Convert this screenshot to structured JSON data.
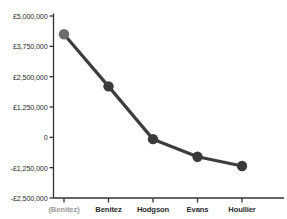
{
  "chart_data": {
    "type": "line",
    "title": "",
    "xlabel": "",
    "ylabel": "",
    "categories": [
      "(Benitez)",
      "Benitez",
      "Hodgson",
      "Evans",
      "Houllier"
    ],
    "values": [
      4250000,
      2100000,
      -75000,
      -800000,
      -1180000
    ],
    "ylim": [
      -2500000,
      5000000
    ],
    "ytick_values": [
      5000000,
      3750000,
      2500000,
      1250000,
      0,
      -1250000,
      -2500000
    ],
    "ytick_labels": [
      "£5,000,000",
      "£3,750,000",
      "£2,500,000",
      "£1,250,000",
      "0",
      "-£1,250,000",
      "-£2,500,000"
    ],
    "grid": false,
    "legend": "none",
    "series": [
      {
        "name": "Net spend",
        "values": [
          4250000,
          2100000,
          -75000,
          -800000,
          -1180000
        ]
      }
    ]
  },
  "axis": {
    "y_axis_name": "y-axis",
    "x_axis_name": "x-axis"
  },
  "style": {
    "line_color": "#3d3d3d",
    "marker_color": "#3a3a3a",
    "first_marker_color": "#6d6d6d",
    "axis_color": "#333333",
    "label_color": "#2b2b2b",
    "muted_label_color": "#9a9a9a",
    "background": "#ffffff"
  }
}
